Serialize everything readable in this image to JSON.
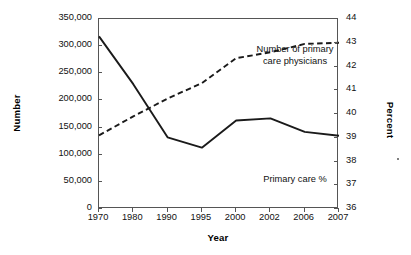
{
  "chart_data": {
    "type": "line",
    "title": "",
    "xlabel": "Year",
    "ylabel": "Number",
    "y2label": "Percent",
    "categories": [
      "1970",
      "1980",
      "1990",
      "1995",
      "2000",
      "2002",
      "2006",
      "2007"
    ],
    "ylim": [
      0,
      350000
    ],
    "y2lim": [
      36,
      44
    ],
    "yticks": [
      "0",
      "50,000",
      "100,000",
      "150,000",
      "200,000",
      "250,000",
      "300,000",
      "350,000"
    ],
    "ytick_values": [
      0,
      50000,
      100000,
      150000,
      200000,
      250000,
      300000,
      350000
    ],
    "y2ticks": [
      "36",
      "37",
      "38",
      "39",
      "40",
      "41",
      "42",
      "43",
      "44"
    ],
    "y2tick_values": [
      36,
      37,
      38,
      39,
      40,
      41,
      42,
      43,
      44
    ],
    "grid": false,
    "legend_position": "inline-annotations",
    "series": [
      {
        "name": "Number of primary care physicians",
        "style": "dashed",
        "axis": "right",
        "unit": "percent",
        "values": [
          39.1,
          39.9,
          40.65,
          41.3,
          42.35,
          42.6,
          42.95,
          43.0
        ]
      },
      {
        "name": "Primary care %",
        "style": "solid",
        "axis": "left",
        "unit": "number",
        "values": [
          318000,
          230000,
          132000,
          113000,
          163000,
          167000,
          142000,
          135000
        ]
      }
    ],
    "annotations": [
      {
        "id": "number-label",
        "line1": "Number of primary",
        "line2": "care physicians"
      },
      {
        "id": "percent-label",
        "line1": "Primary care %",
        "line2": ""
      }
    ]
  },
  "colors": {
    "line": "#1a1a1a",
    "axis": "#555555",
    "text": "#111111",
    "background": "#ffffff"
  }
}
